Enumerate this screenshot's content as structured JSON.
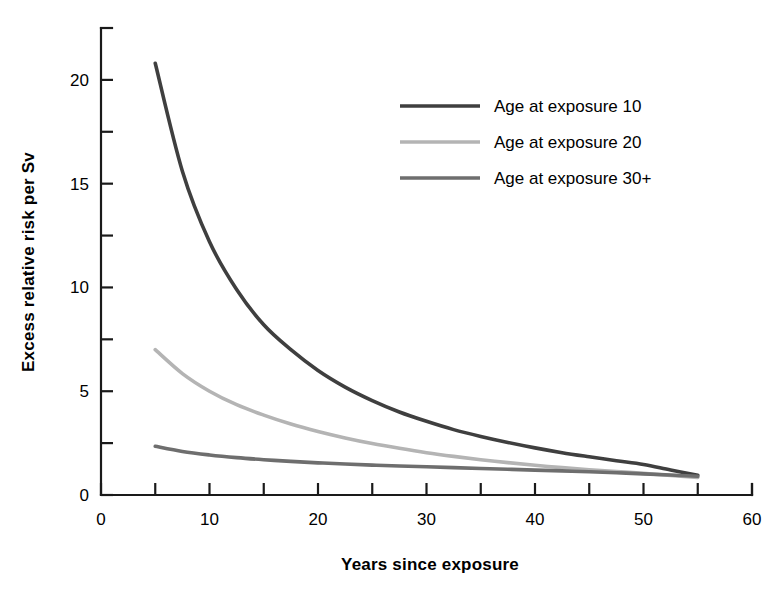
{
  "chart_data": {
    "type": "line",
    "title": "",
    "xlabel": "Years since exposure",
    "ylabel": "Excess relative risk per Sv",
    "xlim": [
      0,
      60
    ],
    "ylim": [
      0,
      22.5
    ],
    "grid": false,
    "legend_position": "upper-right-inside",
    "x_ticks_major": [
      0,
      10,
      20,
      30,
      40,
      50,
      60
    ],
    "x_ticks_major_labels": [
      "0",
      "10",
      "20",
      "30",
      "40",
      "50",
      "60"
    ],
    "x_ticks_minor": [
      5,
      15,
      25,
      35,
      45,
      55
    ],
    "y_ticks_major": [
      0,
      5,
      10,
      15,
      20
    ],
    "y_ticks_major_labels": [
      "0",
      "5",
      "10",
      "15",
      "20"
    ],
    "y_ticks_minor": [
      2.5,
      7.5,
      12.5,
      17.5
    ],
    "x": [
      5,
      7.5,
      10,
      12.5,
      15,
      17.5,
      20,
      22.5,
      25,
      27.5,
      30,
      32.5,
      35,
      37.5,
      40,
      42.5,
      45,
      47.5,
      50,
      52.5,
      55
    ],
    "series": [
      {
        "name": "Age at exposure 10",
        "color": "#3f3f3f",
        "values": [
          20.8,
          15.6,
          12.2,
          9.9,
          8.2,
          7.0,
          6.0,
          5.2,
          4.55,
          4.0,
          3.55,
          3.15,
          2.82,
          2.53,
          2.27,
          2.04,
          1.84,
          1.65,
          1.47,
          1.2,
          0.95
        ]
      },
      {
        "name": "Age at exposure 20",
        "color": "#b4b4b4",
        "values": [
          7.0,
          5.85,
          5.0,
          4.35,
          3.85,
          3.42,
          3.06,
          2.75,
          2.48,
          2.25,
          2.04,
          1.86,
          1.7,
          1.56,
          1.43,
          1.32,
          1.22,
          1.13,
          1.04,
          0.94,
          0.85
        ]
      },
      {
        "name": "Age at exposure 30+",
        "color": "#6e6e6e",
        "values": [
          2.35,
          2.1,
          1.93,
          1.8,
          1.7,
          1.62,
          1.55,
          1.49,
          1.44,
          1.4,
          1.36,
          1.32,
          1.28,
          1.24,
          1.2,
          1.16,
          1.12,
          1.07,
          1.02,
          0.96,
          0.9
        ]
      }
    ]
  },
  "legend": {
    "items": [
      {
        "label": "Age at exposure 10",
        "color": "#3f3f3f"
      },
      {
        "label": "Age at exposure 20",
        "color": "#b4b4b4"
      },
      {
        "label": "Age at exposure 30+",
        "color": "#6e6e6e"
      }
    ]
  },
  "axes": {
    "x_title": "Years since exposure",
    "y_title": "Excess relative risk per Sv"
  }
}
